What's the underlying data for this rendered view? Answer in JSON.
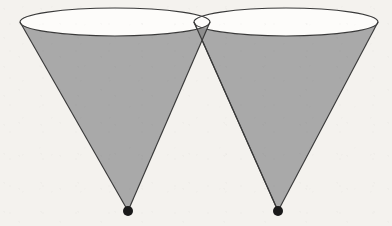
{
  "figure": {
    "kind": "geometry-diagram",
    "background_color": "#f4f2ee",
    "stroke_color": "#3a3a3a",
    "fill_color": "#a9a9a9",
    "overlap_fill_color": "#8e8e8e",
    "apex_dot_color": "#1a1a1a",
    "canvas": {
      "width": 392,
      "height": 226
    },
    "labels": [],
    "annotations": []
  },
  "chart_data": {
    "type": "diagram",
    "xlabel": "",
    "ylabel": "",
    "shapes": [
      {
        "name": "left-cone",
        "kind": "cone",
        "orientation": "apex-down",
        "apex": {
          "x": 128,
          "y": 211
        },
        "rim_ellipse": {
          "center_x": 115,
          "center_y": 22,
          "radius_x": 95,
          "radius_y": 14
        },
        "rim_left_point": {
          "x": 20,
          "y": 22
        },
        "rim_right_point": {
          "x": 210,
          "y": 22
        },
        "fill": "#a9a9a9",
        "stroke": "#3a3a3a"
      },
      {
        "name": "right-cone",
        "kind": "cone",
        "orientation": "apex-down",
        "apex": {
          "x": 278,
          "y": 211
        },
        "rim_ellipse": {
          "center_x": 286,
          "center_y": 22,
          "radius_x": 92,
          "radius_y": 14
        },
        "rim_left_point": {
          "x": 194,
          "y": 22
        },
        "rim_right_point": {
          "x": 378,
          "y": 22
        },
        "fill": "#a9a9a9",
        "stroke": "#3a3a3a"
      }
    ],
    "intersection": {
      "name": "cone-intersection",
      "crossing_point": {
        "x": 203,
        "y": 93
      },
      "visible_lens_ellipse_left": {
        "x": 158,
        "y": 30
      },
      "visible_lens_ellipse_right": {
        "x": 248,
        "y": 30
      },
      "fill": "#8e8e8e"
    },
    "points": [
      {
        "name": "left-apex",
        "x": 128,
        "y": 211,
        "marker": "filled-dot",
        "radius": 5
      },
      {
        "name": "right-apex",
        "x": 278,
        "y": 211,
        "marker": "filled-dot",
        "radius": 5
      }
    ]
  }
}
